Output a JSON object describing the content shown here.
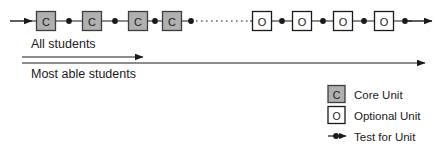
{
  "diagram": {
    "colors": {
      "line": "#1a1a1a",
      "core_fill": "#b0b0b0",
      "core_stroke": "#3d3d3d",
      "optional_fill": "#ffffff",
      "optional_stroke": "#1a1a1a",
      "text": "#1a1a1a",
      "background": "#ffffff"
    },
    "chain": {
      "name": "unit-sequence",
      "start_arrow": true,
      "end_arrow": true,
      "gap_style": "dotted",
      "units": [
        {
          "id": "core-1",
          "type": "core",
          "glyph": "C",
          "x": 46
        },
        {
          "id": "core-2",
          "type": "core",
          "glyph": "C",
          "x": 92
        },
        {
          "id": "core-3",
          "type": "core",
          "glyph": "C",
          "x": 138
        },
        {
          "id": "core-4",
          "type": "core",
          "glyph": "C",
          "x": 172
        },
        {
          "id": "optional-1",
          "type": "optional",
          "glyph": "O",
          "x": 262
        },
        {
          "id": "optional-2",
          "type": "optional",
          "glyph": "O",
          "x": 302
        },
        {
          "id": "optional-3",
          "type": "optional",
          "glyph": "O",
          "x": 343
        },
        {
          "id": "optional-4",
          "type": "optional",
          "glyph": "O",
          "x": 384
        }
      ],
      "tests": [
        {
          "id": "test-1",
          "x": 69
        },
        {
          "id": "test-2",
          "x": 115
        },
        {
          "id": "test-3",
          "x": 155
        },
        {
          "id": "test-4",
          "x": 191
        },
        {
          "id": "test-5",
          "x": 282
        },
        {
          "id": "test-6",
          "x": 323
        },
        {
          "id": "test-7",
          "x": 364
        },
        {
          "id": "test-8",
          "x": 405
        }
      ]
    },
    "flows": [
      {
        "id": "all-students",
        "label": "All students",
        "label_x": 31,
        "label_y": 48,
        "arrow_y": 57,
        "arrow_x1": 22,
        "arrow_x2": 143
      },
      {
        "id": "most-able-students",
        "label": "Most able students",
        "label_x": 31,
        "label_y": 78,
        "arrow_y": 63,
        "arrow_x1": 22,
        "arrow_x2": 425
      }
    ],
    "legend": {
      "name": "diagram-legend",
      "items": [
        {
          "id": "core-unit",
          "symbol": "core",
          "glyph": "C",
          "label": "Core Unit"
        },
        {
          "id": "optional-unit",
          "symbol": "optional",
          "glyph": "O",
          "label": "Optional Unit"
        },
        {
          "id": "test-for-unit",
          "symbol": "test",
          "glyph": "",
          "label": "Test for Unit"
        }
      ]
    }
  }
}
